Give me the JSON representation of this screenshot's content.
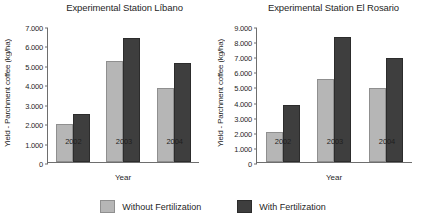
{
  "legend": {
    "position": "bottom-center",
    "entries": [
      {
        "label": "Without Fertilization",
        "color": "#b6b6b6",
        "key": "without"
      },
      {
        "label": "With Fertilization",
        "color": "#3e3e3e",
        "key": "with"
      }
    ]
  },
  "chart_data": [
    {
      "type": "bar",
      "title": "Experimental Station Líbano",
      "xlabel": "Year",
      "ylabel": "Yield - Parchment coffee  (kg/ha)",
      "categories": [
        "2002",
        "2003",
        "2004"
      ],
      "ylim": [
        0,
        7000
      ],
      "yticks": [
        "0",
        "1.000",
        "2.000",
        "3.000",
        "4.000",
        "5.000",
        "6.000",
        "7.000"
      ],
      "ytick_values": [
        0,
        1000,
        2000,
        3000,
        4000,
        5000,
        6000,
        7000
      ],
      "grid": false,
      "series": [
        {
          "name": "Without Fertilization",
          "color": "#b6b6b6",
          "values": [
            1950,
            5200,
            3800
          ]
        },
        {
          "name": "With Fertilization",
          "color": "#3e3e3e",
          "values": [
            2450,
            6400,
            5100
          ]
        }
      ]
    },
    {
      "type": "bar",
      "title": "Experimental Station El Rosario",
      "xlabel": "Year",
      "ylabel": "Yield - Parchment coffee  (kg/ha)",
      "categories": [
        "2002",
        "2003",
        "2004"
      ],
      "ylim": [
        0,
        9000
      ],
      "yticks": [
        "0",
        "1.000",
        "2.000",
        "3.000",
        "4.000",
        "5.000",
        "6.000",
        "7.000",
        "8.000",
        "9.000"
      ],
      "ytick_values": [
        0,
        1000,
        2000,
        3000,
        4000,
        5000,
        6000,
        7000,
        8000,
        9000
      ],
      "grid": false,
      "series": [
        {
          "name": "Without Fertilization",
          "color": "#b6b6b6",
          "values": [
            2000,
            5500,
            4900
          ]
        },
        {
          "name": "With Fertilization",
          "color": "#3e3e3e",
          "values": [
            3750,
            8250,
            6900
          ]
        }
      ]
    }
  ]
}
